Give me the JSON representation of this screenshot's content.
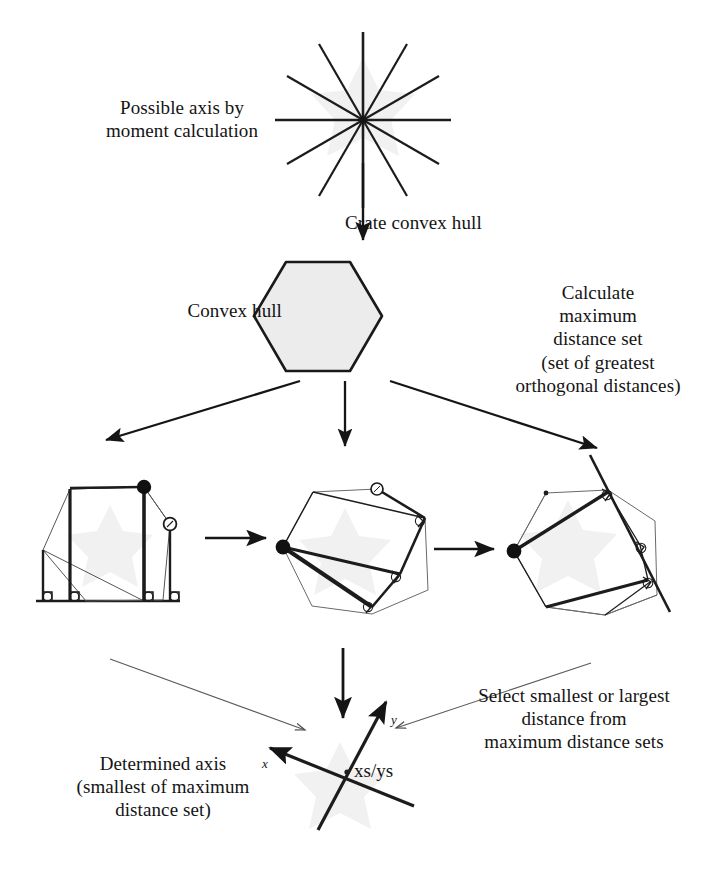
{
  "page": {
    "width": 722,
    "height": 893,
    "background": "#ffffff"
  },
  "colors": {
    "ink": "#141414",
    "stroke_dark": "#1a1a1a",
    "stroke_thin": "#555555",
    "hull_fill": "#ececec",
    "hull_stroke": "#1a1a1a",
    "ghost_fill": "#f0f0f0",
    "marker_fill": "#111111"
  },
  "labels": {
    "possible_axis": "Possible axis by\nmoment calculation",
    "crate_convex_hull": "Crate convex hull",
    "convex_hull": "Convex hull",
    "calculate_max": "Calculate\nmaximum\ndistance set\n(set of greatest\northogonal distances)",
    "select_distance": "Select smallest or largest\ndistance from\nmaximum distance sets",
    "determined_axis": "Determined axis\n(smallest of maximum\ndistance set)",
    "xs_ys": "xs/ys",
    "axis_y": "y",
    "axis_x": "x"
  },
  "figures": {
    "star": {
      "name": "moment-axis-star",
      "center": [
        363,
        120
      ],
      "radius": 88,
      "spokes": 12,
      "spoke_angle_step_deg": 30
    },
    "hexagon": {
      "name": "convex-hull-hexagon",
      "center": [
        318,
        316
      ],
      "radius": 63,
      "orientation": "flat-top",
      "fill": "#ececec"
    },
    "step1": {
      "name": "orthogonal-distance-axis-aligned",
      "caption": "axis aligned bounding measurements",
      "center": [
        110,
        540
      ]
    },
    "step2": {
      "name": "orthogonal-distance-rotated-a",
      "caption": "rotated caliper measurement set A",
      "center": [
        345,
        540
      ]
    },
    "step3": {
      "name": "orthogonal-distance-rotated-b",
      "caption": "rotated caliper measurement set B",
      "center": [
        570,
        540
      ]
    },
    "axis_cross": {
      "name": "determined-axis-cross",
      "origin": [
        341,
        779
      ],
      "y_axis_tip": [
        384,
        700
      ],
      "x_axis_tip": [
        270,
        748
      ]
    }
  },
  "arrows": [
    {
      "name": "arrow-star-to-hull",
      "from": [
        363,
        160
      ],
      "to": [
        363,
        243
      ],
      "style": "thick-vertical"
    },
    {
      "name": "arrow-hull-to-step1",
      "from": [
        300,
        381
      ],
      "to": [
        103,
        441
      ],
      "style": "thick-diagonal-left"
    },
    {
      "name": "arrow-hull-to-step2",
      "from": [
        345,
        383
      ],
      "to": [
        345,
        449
      ],
      "style": "thick-vertical"
    },
    {
      "name": "arrow-hull-to-step3",
      "from": [
        390,
        381
      ],
      "to": [
        600,
        450
      ],
      "style": "thick-diagonal-right"
    },
    {
      "name": "arrow-step1-to-step2",
      "from": [
        205,
        538
      ],
      "to": [
        268,
        538
      ],
      "style": "thick-horizontal"
    },
    {
      "name": "arrow-step2-to-step3",
      "from": [
        432,
        548
      ],
      "to": [
        495,
        548
      ],
      "style": "thick-horizontal"
    },
    {
      "name": "arrow-step2-to-axis",
      "from": [
        343,
        648
      ],
      "to": [
        343,
        722
      ],
      "style": "thick-vertical"
    },
    {
      "name": "arrow-step1-to-axis-thin",
      "from": [
        110,
        658
      ],
      "to": [
        310,
        732
      ],
      "style": "thin-diagonal"
    },
    {
      "name": "arrow-step3-to-axis-thin",
      "from": [
        590,
        663
      ],
      "to": [
        392,
        729
      ],
      "style": "thin-diagonal"
    }
  ]
}
